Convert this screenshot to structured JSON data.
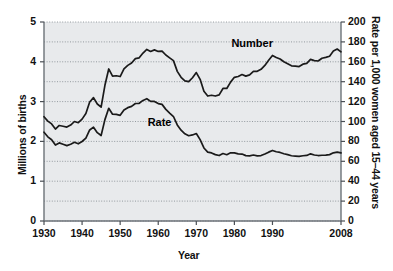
{
  "chart_data": {
    "type": "line",
    "title": "",
    "xlabel": "Year",
    "ylabel": "Millions of births",
    "ylabel_right": "Rate per 1,000 women aged 15–44 years",
    "xlim": [
      1930,
      2008
    ],
    "ylim": [
      0,
      5
    ],
    "ylim_right": [
      0,
      200
    ],
    "xticks": [
      1930,
      1940,
      1950,
      1960,
      1970,
      1980,
      1990,
      2008
    ],
    "xtick_labels": [
      "1930",
      "1940",
      "1950",
      "1960",
      "1970",
      "1980",
      "1990",
      "2008"
    ],
    "yticks": [
      0,
      1,
      2,
      3,
      4,
      5
    ],
    "ytick_labels": [
      "0",
      "1",
      "2",
      "3",
      "4",
      "5"
    ],
    "yticks_right": [
      0,
      20,
      40,
      60,
      80,
      100,
      120,
      140,
      160,
      180,
      200
    ],
    "ytick_labels_right": [
      "0",
      "20",
      "40",
      "60",
      "80",
      "100",
      "120",
      "140",
      "160",
      "180",
      "200"
    ],
    "grid": true,
    "grid_style": "dotted",
    "grid_interval": 0.5,
    "plot_background": "#e8eaec",
    "line_color": "#1a1a1a",
    "legend_position": "inline-annotations",
    "annotations": [
      {
        "text": "Number",
        "x": 1985,
        "y": 4.45
      },
      {
        "text": "Rate",
        "x": 1963,
        "y": 2.45
      }
    ],
    "series": [
      {
        "name": "Number",
        "axis": "left",
        "units": "millions of births",
        "x": [
          1930,
          1931,
          1932,
          1933,
          1934,
          1935,
          1936,
          1937,
          1938,
          1939,
          1940,
          1941,
          1942,
          1943,
          1944,
          1945,
          1946,
          1947,
          1948,
          1949,
          1950,
          1951,
          1952,
          1953,
          1954,
          1955,
          1956,
          1957,
          1958,
          1959,
          1960,
          1961,
          1962,
          1963,
          1964,
          1965,
          1966,
          1967,
          1968,
          1969,
          1970,
          1971,
          1972,
          1973,
          1974,
          1975,
          1976,
          1977,
          1978,
          1979,
          1980,
          1981,
          1982,
          1983,
          1984,
          1985,
          1986,
          1987,
          1988,
          1989,
          1990,
          1991,
          1992,
          1993,
          1994,
          1995,
          1996,
          1997,
          1998,
          1999,
          2000,
          2001,
          2002,
          2003,
          2004,
          2005,
          2006,
          2007,
          2008
        ],
        "values": [
          2.62,
          2.51,
          2.44,
          2.31,
          2.4,
          2.38,
          2.36,
          2.41,
          2.5,
          2.47,
          2.56,
          2.7,
          2.99,
          3.1,
          2.94,
          2.86,
          3.41,
          3.82,
          3.64,
          3.65,
          3.63,
          3.82,
          3.91,
          3.97,
          4.08,
          4.1,
          4.22,
          4.31,
          4.26,
          4.3,
          4.26,
          4.27,
          4.17,
          4.1,
          4.03,
          3.76,
          3.61,
          3.52,
          3.5,
          3.6,
          3.73,
          3.56,
          3.26,
          3.14,
          3.16,
          3.14,
          3.17,
          3.33,
          3.33,
          3.49,
          3.61,
          3.63,
          3.68,
          3.64,
          3.67,
          3.76,
          3.76,
          3.81,
          3.91,
          4.04,
          4.16,
          4.11,
          4.07,
          4.0,
          3.95,
          3.9,
          3.89,
          3.88,
          3.94,
          3.96,
          4.06,
          4.03,
          4.02,
          4.09,
          4.11,
          4.14,
          4.27,
          4.32,
          4.25
        ]
      },
      {
        "name": "Rate",
        "axis": "right",
        "units": "births per 1,000 women aged 15-44",
        "x": [
          1930,
          1931,
          1932,
          1933,
          1934,
          1935,
          1936,
          1937,
          1938,
          1939,
          1940,
          1941,
          1942,
          1943,
          1944,
          1945,
          1946,
          1947,
          1948,
          1949,
          1950,
          1951,
          1952,
          1953,
          1954,
          1955,
          1956,
          1957,
          1958,
          1959,
          1960,
          1961,
          1962,
          1963,
          1964,
          1965,
          1966,
          1967,
          1968,
          1969,
          1970,
          1971,
          1972,
          1973,
          1974,
          1975,
          1976,
          1977,
          1978,
          1979,
          1980,
          1981,
          1982,
          1983,
          1984,
          1985,
          1986,
          1987,
          1988,
          1989,
          1990,
          1991,
          1992,
          1993,
          1994,
          1995,
          1996,
          1997,
          1998,
          1999,
          2000,
          2001,
          2002,
          2003,
          2004,
          2005,
          2006,
          2007,
          2008
        ],
        "values": [
          89.2,
          84.6,
          81.7,
          76.3,
          78.5,
          77.2,
          75.8,
          77.1,
          79.1,
          77.6,
          79.9,
          83.4,
          91.5,
          94.3,
          88.8,
          85.9,
          101.9,
          113.3,
          107.3,
          107.1,
          106.2,
          111.5,
          113.9,
          115.2,
          118.1,
          118.3,
          121.2,
          122.9,
          120.2,
          120.2,
          118.0,
          117.2,
          112.2,
          108.5,
          105.0,
          96.6,
          91.3,
          87.6,
          85.7,
          86.5,
          87.9,
          81.8,
          73.4,
          69.2,
          68.4,
          66.7,
          65.8,
          67.8,
          66.6,
          68.5,
          68.4,
          67.4,
          67.3,
          65.7,
          65.5,
          66.3,
          65.4,
          65.8,
          67.3,
          69.2,
          70.9,
          69.6,
          68.9,
          67.6,
          66.7,
          65.6,
          65.3,
          65.0,
          65.6,
          65.9,
          67.5,
          66.3,
          65.8,
          66.1,
          66.3,
          66.7,
          68.5,
          69.3,
          68.4
        ]
      }
    ]
  },
  "labels": {
    "series_number": "Number",
    "series_rate": "Rate"
  }
}
